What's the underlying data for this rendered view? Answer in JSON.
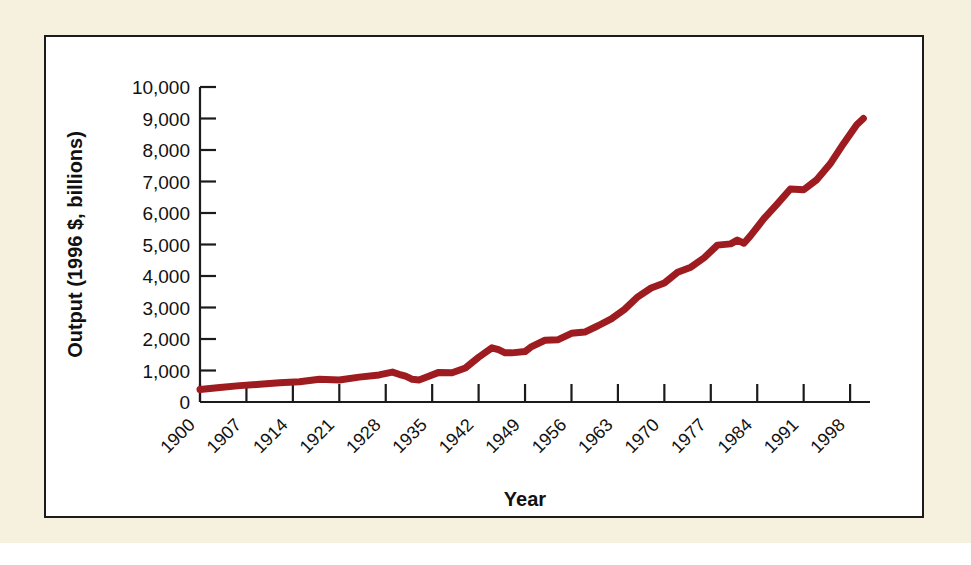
{
  "figure": {
    "background_color": "#f6f1df",
    "panel_background": "#ffffff",
    "panel_border_color": "#1b1b1b"
  },
  "chart_data": {
    "type": "line",
    "title": "",
    "subtitle": "",
    "xlabel": "Year",
    "ylabel": "Output (1996 $, billions)",
    "xlim": [
      1900,
      2001
    ],
    "ylim": [
      0,
      10000
    ],
    "grid": false,
    "legend": "none",
    "line_color": "#9e1b20",
    "line_width_px": 7,
    "xtick_labels": [
      "1900",
      "1907",
      "1914",
      "1921",
      "1928",
      "1935",
      "1942",
      "1949",
      "1956",
      "1963",
      "1970",
      "1977",
      "1984",
      "1991",
      "1998"
    ],
    "xtick_values": [
      1900,
      1907,
      1914,
      1921,
      1928,
      1935,
      1942,
      1949,
      1956,
      1963,
      1970,
      1977,
      1984,
      1991,
      1998
    ],
    "ytick_labels": [
      "0",
      "1,000",
      "2,000",
      "3,000",
      "4,000",
      "5,000",
      "6,000",
      "7,000",
      "8,000",
      "9,000",
      "10,000"
    ],
    "ytick_values": [
      0,
      1000,
      2000,
      3000,
      4000,
      5000,
      6000,
      7000,
      8000,
      9000,
      10000
    ],
    "series": [
      {
        "name": "Real U.S. Output",
        "x": [
          1900,
          1903,
          1906,
          1909,
          1912,
          1915,
          1918,
          1921,
          1924,
          1927,
          1929,
          1930,
          1931,
          1932,
          1933,
          1934,
          1936,
          1938,
          1940,
          1942,
          1944,
          1945,
          1946,
          1947,
          1949,
          1950,
          1952,
          1954,
          1956,
          1958,
          1960,
          1962,
          1964,
          1966,
          1968,
          1970,
          1972,
          1974,
          1976,
          1978,
          1980,
          1981,
          1982,
          1983,
          1985,
          1987,
          1989,
          1991,
          1993,
          1995,
          1997,
          1999,
          2000
        ],
        "y": [
          400,
          460,
          520,
          560,
          610,
          640,
          720,
          700,
          790,
          860,
          950,
          880,
          820,
          720,
          700,
          780,
          940,
          930,
          1080,
          1420,
          1720,
          1660,
          1560,
          1560,
          1600,
          1760,
          1960,
          1980,
          2180,
          2220,
          2420,
          2640,
          2940,
          3340,
          3620,
          3780,
          4120,
          4280,
          4580,
          4980,
          5020,
          5140,
          5040,
          5280,
          5820,
          6280,
          6760,
          6740,
          7060,
          7560,
          8200,
          8800,
          9000
        ]
      }
    ],
    "annotations": []
  }
}
